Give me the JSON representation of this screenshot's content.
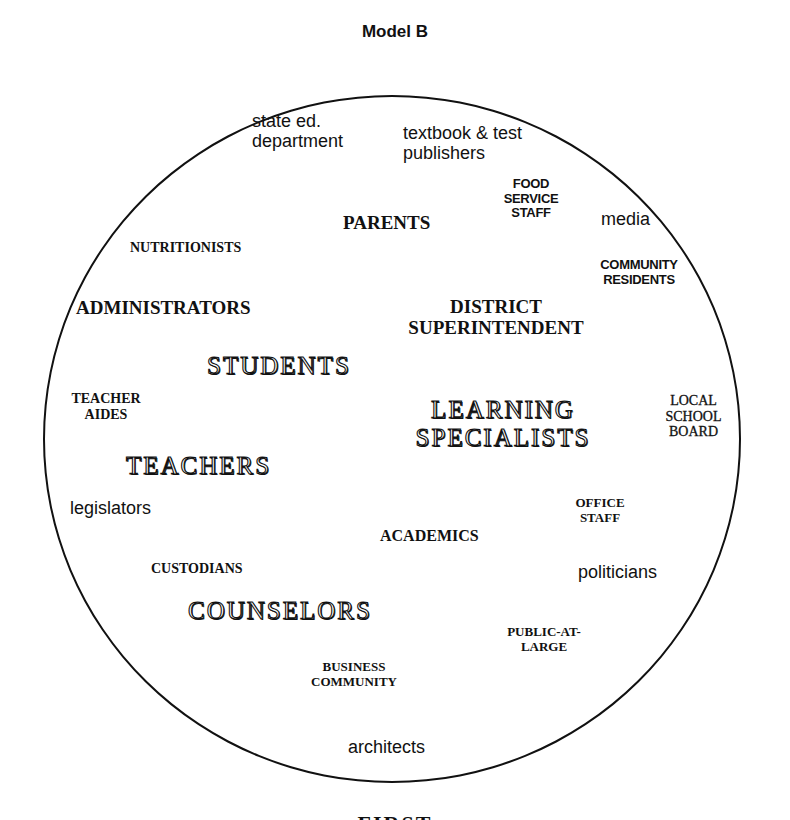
{
  "title": "Model B",
  "diagram": {
    "shape": "circle",
    "labels": {
      "state_ed": "state ed.\ndepartment",
      "textbook": "textbook & test\npublishers",
      "food_service": "FOOD\nSERVICE\nSTAFF",
      "parents": "PARENTS",
      "media": "media",
      "nutritionists": "NUTRITIONISTS",
      "community_residents": "COMMUNITY\nRESIDENTS",
      "administrators": "ADMINISTRATORS",
      "district_superintendent": "DISTRICT\nSUPERINTENDENT",
      "students": "STUDENTS",
      "teacher_aides": "TEACHER\nAIDES",
      "learning_specialists": "LEARNING\nSPECIALISTS",
      "local_school_board": "LOCAL\nSCHOOL\nBOARD",
      "teachers": "TEACHERS",
      "legislators": "legislators",
      "office_staff": "OFFICE\nSTAFF",
      "academics": "ACADEMICS",
      "custodians": "CUSTODIANS",
      "politicians": "politicians",
      "counselors": "COUNSELORS",
      "public_at_large": "PUBLIC-AT-\nLARGE",
      "business_community": "BUSINESS\nCOMMUNITY",
      "architects": "architects"
    }
  },
  "footer": {
    "partial_text": "FIRST"
  }
}
